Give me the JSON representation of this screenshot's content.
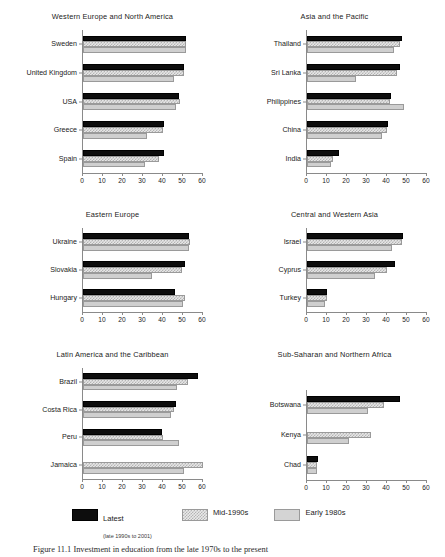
{
  "legend": {
    "items": [
      {
        "key": "latest",
        "label": "Latest",
        "sublabel": "(late 1990s to 2001)",
        "color": "#0d0d0d"
      },
      {
        "key": "mid",
        "label": "Mid-1990s",
        "sublabel": "",
        "color": "#b4b4b4"
      },
      {
        "key": "early",
        "label": "Early 1980s",
        "sublabel": "",
        "color": "#cfcfcf"
      }
    ]
  },
  "caption": "Figure 11.1  Investment in education from the late 1970s to the present",
  "chart_data": [
    {
      "type": "bar",
      "title": "Western Europe and North America",
      "orientation": "horizontal",
      "categories": [
        "Sweden",
        "United Kingdom",
        "USA",
        "Greece",
        "Spain"
      ],
      "xlabel": "",
      "ylabel": "",
      "xlim": [
        0,
        60
      ],
      "xticks": [
        0,
        10,
        20,
        30,
        40,
        50,
        60
      ],
      "grid": false,
      "legend_position": "bottom",
      "series": [
        {
          "name": "Latest",
          "values": [
            51.5,
            50.5,
            48,
            40.5,
            40.5
          ]
        },
        {
          "name": "Mid-1990s",
          "values": [
            51.5,
            50.5,
            48.5,
            40,
            38
          ]
        },
        {
          "name": "Early 1980s",
          "values": [
            51.5,
            45.5,
            46.5,
            32,
            31
          ]
        }
      ]
    },
    {
      "type": "bar",
      "title": "Asia and the Pacific",
      "orientation": "horizontal",
      "categories": [
        "Thailand",
        "Sri Lanka",
        "Philippines",
        "China",
        "India"
      ],
      "xlabel": "",
      "ylabel": "",
      "xlim": [
        0,
        60
      ],
      "xticks": [
        0,
        10,
        20,
        30,
        40,
        50,
        60
      ],
      "grid": false,
      "legend_position": "bottom",
      "series": [
        {
          "name": "Latest",
          "values": [
            47.5,
            46.5,
            42,
            40.5,
            16
          ]
        },
        {
          "name": "Mid-1990s",
          "values": [
            46.5,
            45,
            41.5,
            40,
            13
          ]
        },
        {
          "name": "Early 1980s",
          "values": [
            43.5,
            24.5,
            48.5,
            37.5,
            12
          ]
        }
      ]
    },
    {
      "type": "bar",
      "title": "Eastern Europe",
      "orientation": "horizontal",
      "categories": [
        "Ukraine",
        "Slovakia",
        "Hungary"
      ],
      "xlabel": "",
      "ylabel": "",
      "xlim": [
        0,
        60
      ],
      "xticks": [
        0,
        10,
        20,
        30,
        40,
        50,
        60
      ],
      "grid": false,
      "legend_position": "bottom",
      "series": [
        {
          "name": "Latest",
          "values": [
            53,
            51,
            46
          ]
        },
        {
          "name": "Mid-1990s",
          "values": [
            53.5,
            49.5,
            51
          ]
        },
        {
          "name": "Early 1980s",
          "values": [
            53,
            34.5,
            50
          ]
        }
      ]
    },
    {
      "type": "bar",
      "title": "Central and Western Asia",
      "orientation": "horizontal",
      "categories": [
        "Israel",
        "Cyprus",
        "Turkey"
      ],
      "xlabel": "",
      "ylabel": "",
      "xlim": [
        0,
        60
      ],
      "xticks": [
        0,
        10,
        20,
        30,
        40,
        50,
        60
      ],
      "grid": false,
      "legend_position": "bottom",
      "series": [
        {
          "name": "Latest",
          "values": [
            48,
            44,
            10
          ]
        },
        {
          "name": "Mid-1990s",
          "values": [
            47.5,
            40,
            10
          ]
        },
        {
          "name": "Early 1980s",
          "values": [
            42.5,
            34,
            9
          ]
        }
      ]
    },
    {
      "type": "bar",
      "title": "Latin America and the Caribbean",
      "orientation": "horizontal",
      "categories": [
        "Brazil",
        "Costa Rica",
        "Peru",
        "Jamaica"
      ],
      "xlabel": "",
      "ylabel": "",
      "xlim": [
        0,
        60
      ],
      "xticks": [
        0,
        10,
        20,
        30,
        40,
        50,
        60
      ],
      "grid": false,
      "legend_position": "bottom",
      "series": [
        {
          "name": "Latest",
          "values": [
            57.5,
            46.5,
            39.5,
            null
          ]
        },
        {
          "name": "Mid-1990s",
          "values": [
            52.5,
            45.5,
            40,
            60
          ]
        },
        {
          "name": "Early 1980s",
          "values": [
            47,
            44,
            48,
            50.5
          ]
        }
      ]
    },
    {
      "type": "bar",
      "title": "Sub-Saharan and Northern Africa",
      "orientation": "horizontal",
      "categories": [
        "Botswana",
        "Kenya",
        "Chad"
      ],
      "xlabel": "",
      "ylabel": "",
      "xlim": [
        0,
        60
      ],
      "xticks": [
        0,
        10,
        20,
        30,
        40,
        50,
        60
      ],
      "grid": false,
      "legend_position": "bottom",
      "series": [
        {
          "name": "Latest",
          "values": [
            46.5,
            null,
            5.5
          ]
        },
        {
          "name": "Mid-1990s",
          "values": [
            38.5,
            32,
            5
          ]
        },
        {
          "name": "Early 1980s",
          "values": [
            30.5,
            21,
            5
          ]
        }
      ]
    }
  ]
}
